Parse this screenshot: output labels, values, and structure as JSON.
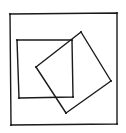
{
  "diagram": {
    "stroke_color": "#1a1a1a",
    "background_color": "#ffffff",
    "shapes": [
      {
        "name": "outer-square",
        "points": [
          [
            10,
            14
          ],
          [
            117,
            13
          ],
          [
            117,
            124
          ],
          [
            11,
            125
          ]
        ]
      },
      {
        "name": "inner-square",
        "points": [
          [
            17,
            40
          ],
          [
            72,
            40
          ],
          [
            73,
            97
          ],
          [
            19,
            98
          ]
        ]
      },
      {
        "name": "rotated-square",
        "points": [
          [
            36,
            67
          ],
          [
            81,
            32
          ],
          [
            111,
            81
          ],
          [
            66,
            113
          ]
        ]
      }
    ]
  }
}
